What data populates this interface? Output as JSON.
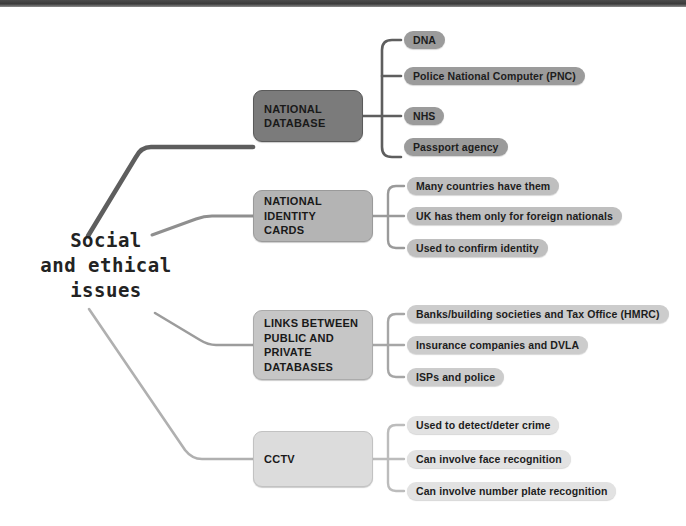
{
  "diagram": {
    "type": "mind-map",
    "title_lines": "Social\nand ethical\nissues",
    "root": {
      "label": "Social and ethical issues"
    },
    "colors": {
      "branch_1": "#7b7b7b",
      "branch_2": "#b4b4b4",
      "branch_3": "#c6c6c6",
      "branch_4": "#dcdcdc",
      "leaf_1": "#9b9b9b",
      "leaf_2": "#bfbfbf",
      "leaf_3": "#cccccc",
      "leaf_4": "#e2e2e2",
      "text": "#1d1d1d",
      "topbar": "#3a3a3a",
      "background": "#ffffff"
    },
    "branches": [
      {
        "id": "national-database",
        "label": "NATIONAL\nDATABASE",
        "leaves": [
          {
            "label": "DNA"
          },
          {
            "label": "Police National Computer (PNC)"
          },
          {
            "label": "NHS"
          },
          {
            "label": "Passport agency"
          }
        ]
      },
      {
        "id": "national-identity-cards",
        "label": "NATIONAL IDENTITY\nCARDS",
        "leaves": [
          {
            "label": "Many countries have them"
          },
          {
            "label": "UK has them only for foreign nationals"
          },
          {
            "label": "Used to confirm identity"
          }
        ]
      },
      {
        "id": "links-between-public-and-private-databases",
        "label": "LINKS BETWEEN\nPUBLIC AND PRIVATE\nDATABASES",
        "leaves": [
          {
            "label": "Banks/building societies and Tax Office  (HMRC)"
          },
          {
            "label": "Insurance companies and DVLA"
          },
          {
            "label": "ISPs and police"
          }
        ]
      },
      {
        "id": "cctv",
        "label": "CCTV",
        "leaves": [
          {
            "label": "Used to detect/deter crime"
          },
          {
            "label": "Can involve face recognition"
          },
          {
            "label": "Can involve number plate recognition"
          }
        ]
      }
    ]
  }
}
